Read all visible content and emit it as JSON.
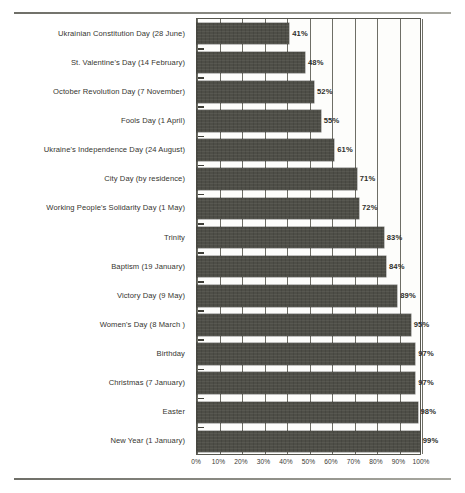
{
  "document": {
    "top_rule": "horizontal-rule",
    "bottom_rule": "horizontal-rule"
  },
  "chart_data": {
    "type": "bar",
    "orientation": "horizontal",
    "title": "",
    "subtitle": "",
    "xlabel": "",
    "ylabel": "",
    "xlim": [
      0,
      100
    ],
    "grid": true,
    "legend": false,
    "value_label_suffix": "%",
    "x_ticks": [
      "0%",
      "10%",
      "20%",
      "30%",
      "40%",
      "50%",
      "60%",
      "70%",
      "80%",
      "90%",
      "100%"
    ],
    "x_tick_values": [
      0,
      10,
      20,
      30,
      40,
      50,
      60,
      70,
      80,
      90,
      100
    ],
    "categories": [
      "Ukrainian Constitution Day (28 June)",
      "St. Valentine's Day  (14 February)",
      "October Revolution Day (7 November)",
      "Fools Day (1 April)",
      "Ukraine's Independence Day (24 August)",
      "City Day (by residence)",
      "Working People's Solidarity Day (1 May)",
      "Trinity",
      "Baptism (19 January)",
      "Victory Day (9 May)",
      "Women's Day (8 March )",
      "Birthday",
      "Christmas (7 January)",
      "Easter",
      "New Year (1 January)"
    ],
    "values": [
      41,
      48,
      52,
      55,
      61,
      71,
      72,
      83,
      84,
      89,
      95,
      97,
      97,
      98,
      99
    ],
    "value_labels": [
      "41%",
      "48%",
      "52%",
      "55%",
      "61%",
      "71%",
      "72%",
      "83%",
      "84%",
      "89%",
      "95%",
      "97%",
      "97%",
      "98%",
      "99%"
    ],
    "colors": {
      "bar_fill": "#4e4e47",
      "plot_border": "#57574f",
      "gridline": "#6e6e66",
      "background": "#ffffff",
      "text": "#35352f"
    }
  }
}
